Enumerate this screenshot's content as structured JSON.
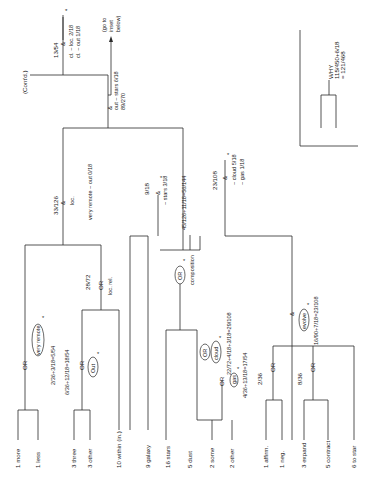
{
  "diagram": {
    "title": "WHY",
    "why_formula": "115/450+6/18",
    "why_result": "= 121/468",
    "contd": "(Cont'd.)",
    "top": {
      "ratio": "13/54",
      "op": "&",
      "cond1": "cl. ~ loc. 2/18",
      "cond2": "cl. ~ out 1/18",
      "star": "*",
      "goto1": "(go to",
      "goto2": "inset",
      "goto3": "below)",
      "root_op": "&",
      "root_cond": "out ~ stars 6/18",
      "root_ratio": "89/270"
    },
    "left_branch": {
      "ratio": "33/126",
      "op": "&",
      "sub": "loc.",
      "cond": "very remote ~ out 0/18",
      "very_remote_or": "OR",
      "very_remote_label": "very remote",
      "very_remote_star": "*",
      "very_remote_formula": "2/36+3/18=5/54",
      "out_or": "OR",
      "out_label": "Out",
      "out_star": "*",
      "out_formula": "6/36+12/18=18/54",
      "locrel_ratio": "28/72",
      "locrel_op": "OR",
      "locrel_label": "loc. rel."
    },
    "mid_branch": {
      "total": "45/126+11/18=56/144",
      "stars_ratio": "9/18",
      "stars_op": "&",
      "stars_cond": "~ stars 3/18",
      "stars_star": "*",
      "comp_or": "OR",
      "comp_star": "*",
      "comp_label": "composition",
      "cloud_or": "OR",
      "cloud_label": "cloud",
      "cloud_star": "*",
      "cloud_formula": "22/72+4/18+3/18=29/108",
      "gas_or": "OR",
      "gas_label": "gas",
      "gas_star": "*",
      "gas_formula": "4/36+13/18=17/54"
    },
    "right_branch": {
      "ratio": "23/108",
      "op": "&",
      "cond1": "~ cloud 5/18",
      "cond2": "~ gas 1/18",
      "star": "*",
      "evolve_op": "&",
      "evolve_label": "evolve",
      "evolve_star": "*",
      "evolve_formula": "16/90+7/18=23/108",
      "aff_ratio": "2/36",
      "aff_or": "OR",
      "exp_ratio": "8/36",
      "exp_or": "OR"
    },
    "leaves": [
      {
        "label": "1 more"
      },
      {
        "label": "1 less"
      },
      {
        "label": "3 three"
      },
      {
        "label": "3 other"
      },
      {
        "label": "10 within (in.)"
      },
      {
        "label": "9 galaxy"
      },
      {
        "label": "16 stars"
      },
      {
        "label": "5 dust"
      },
      {
        "label": "2 some"
      },
      {
        "label": "2 other"
      },
      {
        "label": "1 affirm."
      },
      {
        "label": "1 neg."
      },
      {
        "label": "3 expand"
      },
      {
        "label": "5 contract"
      },
      {
        "label": "6 to star"
      }
    ]
  }
}
